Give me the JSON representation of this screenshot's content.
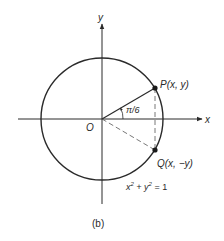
{
  "figure": {
    "caption": "(b)",
    "equation": {
      "prefix": "x",
      "sup1": "2",
      "mid": " + y",
      "sup2": "2",
      "suffix": " = 1"
    },
    "labels": {
      "x_axis": "x",
      "y_axis": "y",
      "origin": "O",
      "point_p": "P(x, y)",
      "point_q": "Q(x, −y)",
      "angle": "π/6"
    },
    "geometry": {
      "center": [
        102,
        119
      ],
      "radius": 61,
      "angle_deg": 30
    },
    "colors": {
      "stroke": "#2a2a2a",
      "dashed": "#555555",
      "background": "#ffffff"
    }
  }
}
